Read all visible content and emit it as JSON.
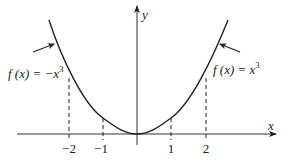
{
  "diagram": {
    "axes": {
      "x_label": "x",
      "y_label": "y"
    },
    "ticks": [
      {
        "value": -2,
        "label": "−2"
      },
      {
        "value": -1,
        "label": "−1"
      },
      {
        "value": 1,
        "label": "1"
      },
      {
        "value": 2,
        "label": "2"
      }
    ],
    "annotations": {
      "left": {
        "prefix": "f (x) = −x",
        "exponent": "3"
      },
      "right": {
        "prefix": "f (x) = x",
        "exponent": "3"
      }
    },
    "colors": {
      "stroke": "#222222",
      "background": "#ffffff"
    }
  }
}
